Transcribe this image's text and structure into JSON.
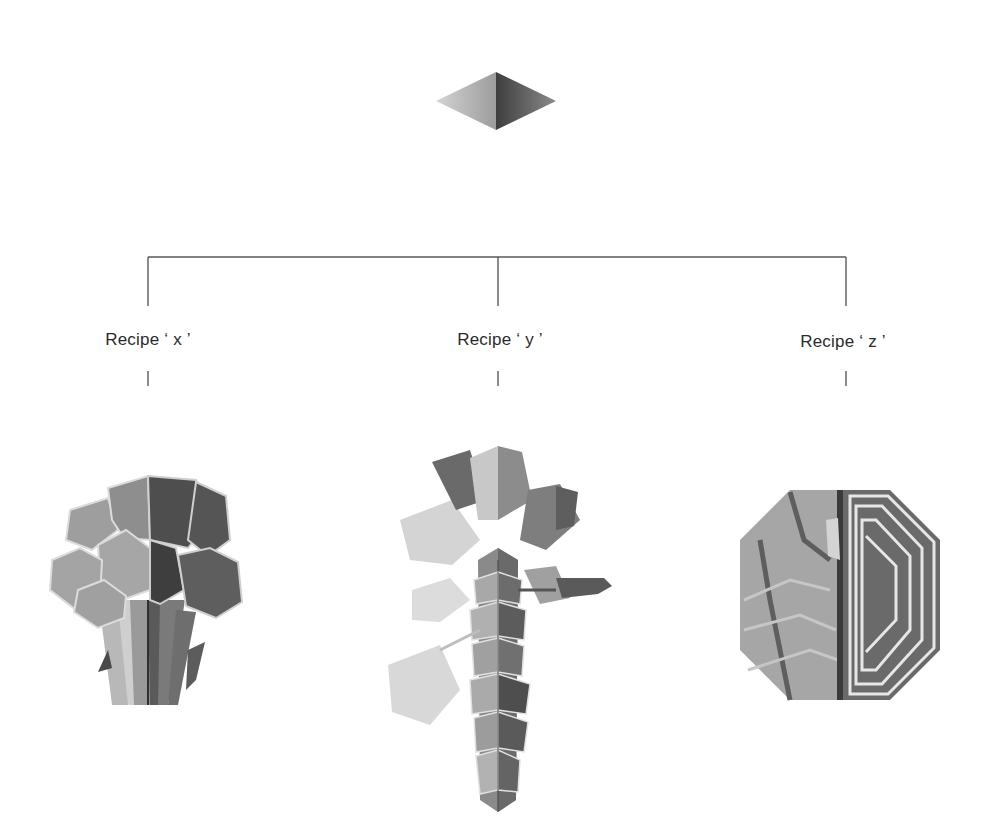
{
  "diagram": {
    "type": "tree",
    "root": {
      "shape": "diamond",
      "label": ""
    },
    "branches": [
      {
        "id": "x",
        "label": "Recipe ‘ x ’",
        "illustration": "broccoli"
      },
      {
        "id": "y",
        "label": "Recipe ‘ y ’",
        "illustration": "brussels-sprout-stalk"
      },
      {
        "id": "z",
        "label": "Recipe ‘ z ’",
        "illustration": "cabbage-cross-section"
      }
    ]
  },
  "colors": {
    "line": "#5a5a5a",
    "text": "#2b2b2b",
    "background": "#ffffff",
    "light_half": "#a8a8a8",
    "dark_half": "#555555"
  }
}
